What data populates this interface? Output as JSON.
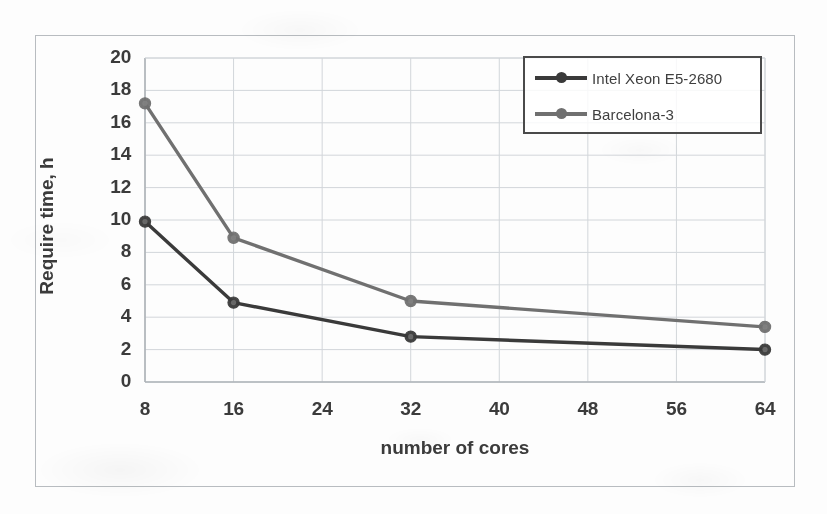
{
  "chart_data": {
    "type": "line",
    "title": "",
    "xlabel": "number of cores",
    "ylabel": "Require time, h",
    "x": [
      8,
      16,
      32,
      64
    ],
    "xticks": [
      "8",
      "16",
      "24",
      "32",
      "40",
      "48",
      "56",
      "64"
    ],
    "xtick_values": [
      8,
      16,
      24,
      32,
      40,
      48,
      56,
      64
    ],
    "yticks": [
      "0",
      "2",
      "4",
      "6",
      "8",
      "10",
      "12",
      "14",
      "16",
      "18",
      "20"
    ],
    "ytick_values": [
      0,
      2,
      4,
      6,
      8,
      10,
      12,
      14,
      16,
      18,
      20
    ],
    "xlim": [
      8,
      64
    ],
    "ylim": [
      0,
      20
    ],
    "grid": true,
    "grid_axes": "both",
    "legend_position": "top-right",
    "series": [
      {
        "name": "Intel Xeon E5-2680",
        "color": "#3a3a3a",
        "marker": "circle",
        "values": [
          9.9,
          4.9,
          2.8,
          2.0
        ]
      },
      {
        "name": "Barcelona-3",
        "color": "#707070",
        "marker": "circle",
        "values": [
          17.2,
          8.9,
          5.0,
          3.4
        ]
      }
    ]
  },
  "colors": {
    "series_intel": "#3a3a3a",
    "series_barcelona": "#707070",
    "grid": "#d2d6da",
    "axis": "#aeb3b8",
    "frame": "#b8bcc0",
    "text": "#3b3b3b",
    "legend_border": "#4a4a4a"
  }
}
